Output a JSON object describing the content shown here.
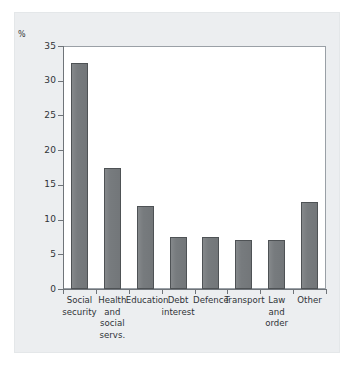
{
  "chart_data": {
    "type": "bar",
    "title": "",
    "subtitle": "",
    "xlabel": "",
    "ylabel": "%",
    "ylim": [
      0,
      35
    ],
    "yticks": [
      0,
      5,
      10,
      15,
      20,
      25,
      30,
      35
    ],
    "ytick_labels": [
      "0",
      "5",
      "10",
      "15",
      "20",
      "25",
      "30",
      "35"
    ],
    "grid": false,
    "legend": null,
    "bar_color": "#777b7e",
    "bar_edge_color": "#4e5255",
    "background_color": "#eceef0",
    "plot_background_color": "#ffffff",
    "axis_color": "#6f7479",
    "categories": [
      "Social\nsecurity",
      "Health\nand\nsocial\nservs.",
      "Education",
      "Debt\ninterest",
      "Defence",
      "Transport",
      "Law\nand\norder",
      "Other"
    ],
    "values": [
      32.5,
      17.5,
      12,
      7.5,
      7.5,
      7,
      7,
      12.5
    ]
  },
  "axis": {
    "y_unit_label": "%",
    "tick_labels": [
      "35",
      "30",
      "25",
      "20",
      "15",
      "10",
      "5",
      "0"
    ]
  }
}
